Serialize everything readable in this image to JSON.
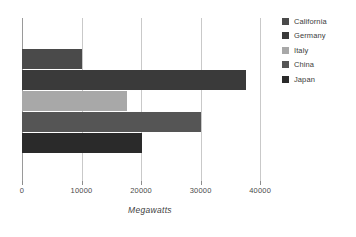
{
  "chart_data": {
    "type": "bar",
    "orientation": "horizontal",
    "title": "",
    "xlabel": "Megawatts",
    "ylabel": "",
    "categories": [
      "California",
      "Germany",
      "Italy",
      "China",
      "Japan"
    ],
    "values": [
      10000,
      37600,
      17700,
      30000,
      20100
    ],
    "series": [
      {
        "name": "Megawatts",
        "values": [
          10000,
          37600,
          17700,
          30000,
          20100
        ]
      }
    ],
    "xlim": [
      0,
      43000
    ],
    "xticks": [
      0,
      10000,
      20000,
      30000,
      40000
    ],
    "xtick_labels": [
      "0",
      "10000",
      "20000",
      "30000",
      "40000"
    ],
    "grid": true,
    "grid_axis": "x",
    "legend_position": "right",
    "colors": {
      "California": "#4a4a4a",
      "Germany": "#3a3a3a",
      "Italy": "#a8a8a8",
      "China": "#555555",
      "Japan": "#2a2a2a"
    },
    "axis_color": "#9a9a9a",
    "gridline_color": "#c9c9c9",
    "background": "#ffffff"
  },
  "legend": {
    "items": [
      {
        "label": "California",
        "color": "#4a4a4a"
      },
      {
        "label": "Germany",
        "color": "#3a3a3a"
      },
      {
        "label": "Italy",
        "color": "#a8a8a8"
      },
      {
        "label": "China",
        "color": "#555555"
      },
      {
        "label": "Japan",
        "color": "#2a2a2a"
      }
    ]
  },
  "axis": {
    "title": "Megawatts",
    "ticks": [
      "0",
      "10000",
      "20000",
      "30000",
      "40000"
    ]
  }
}
